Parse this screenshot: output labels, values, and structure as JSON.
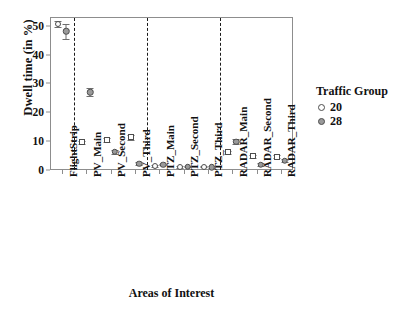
{
  "chart_data": {
    "type": "scatter",
    "title": "",
    "xlabel": "Areas of Interest",
    "ylabel": "Dwell time (in %)",
    "ylim": [
      0,
      53
    ],
    "yticks": [
      0,
      10,
      20,
      30,
      40,
      50
    ],
    "grid": false,
    "legend": {
      "title": "Traffic Group",
      "position": "right",
      "entries": [
        {
          "name": "20",
          "marker": "open-circle",
          "color": "#ffffff"
        },
        {
          "name": "28",
          "marker": "filled-circle",
          "color": "#9a9a9a"
        }
      ]
    },
    "categories": [
      "FlightStrip",
      "PV_Main",
      "PV_Second",
      "PV_Third",
      "PTZ_Main",
      "PTZ_Second",
      "PTZ_Third",
      "RADAR_Main",
      "RADAR_Second",
      "RADAR_Third"
    ],
    "group_separators_after": [
      "FlightStrip",
      "PV_Third",
      "PTZ_Third"
    ],
    "series": [
      {
        "name": "20",
        "marker": "open",
        "values": [
          50.5,
          9.6,
          10.4,
          11.3,
          1.3,
          1.1,
          1.2,
          6.1,
          4.8,
          4.6
        ],
        "errors": [
          1.0,
          0.6,
          0.7,
          0.8,
          0.3,
          0.3,
          0.3,
          0.6,
          0.5,
          0.5
        ]
      },
      {
        "name": "28",
        "marker": "filled",
        "values": [
          48.0,
          27.0,
          6.3,
          2.2,
          1.9,
          1.2,
          1.0,
          9.8,
          1.9,
          3.2
        ],
        "errors": [
          2.6,
          1.3,
          0.6,
          0.4,
          0.3,
          0.3,
          0.3,
          0.9,
          0.4,
          0.5
        ]
      }
    ]
  }
}
